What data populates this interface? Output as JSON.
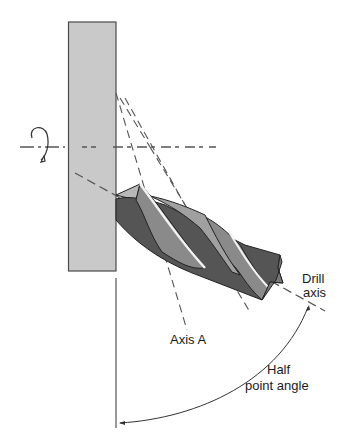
{
  "diagram": {
    "labels": {
      "drill_axis_line1": "Drill",
      "drill_axis_line2": "axis",
      "axis_a": "Axis A",
      "half_angle_line1": "Half",
      "half_angle_line2": "point angle"
    },
    "colors": {
      "workpiece_fill": "#c9c9c9",
      "workpiece_stroke": "#4a4a4a",
      "drill_dark": "#555555",
      "drill_mid": "#7e7e7e",
      "drill_light": "#a9a9a9",
      "drill_highlight": "#f2f2f2",
      "axis_dash": "#555555"
    },
    "icons": {
      "rotation": "rotation-arrow-icon"
    }
  }
}
